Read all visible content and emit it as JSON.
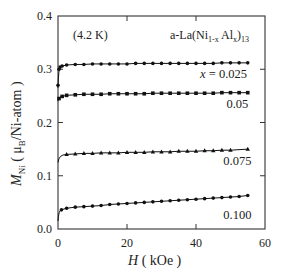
{
  "chart_data": {
    "type": "scatter",
    "title": "a-La(Ni1-x Alx)13",
    "title_parts": {
      "prefix": "a-La(Ni",
      "sub1": "1-x",
      "mid": " Al",
      "sub2": "x",
      "close": ")",
      "sub3": "13"
    },
    "temperature_annotation": "(4.2 K)",
    "xlabel": "H ( kOe )",
    "xlabel_parts": {
      "var": "H",
      "unit": " ( kOe )"
    },
    "ylabel": "M_Ni ( μ_B/Ni-atom )",
    "ylabel_parts": {
      "var": "M",
      "var_sub": "Ni",
      "open": " ( μ",
      "mu_sub": "B",
      "rest": "/Ni-atom )"
    },
    "xlim": [
      0,
      60
    ],
    "ylim": [
      0.0,
      0.4
    ],
    "xticks": [
      0,
      20,
      40,
      60
    ],
    "xtick_labels": [
      "0",
      "20",
      "40",
      "60"
    ],
    "yticks": [
      0.0,
      0.1,
      0.2,
      0.3,
      0.4
    ],
    "ytick_labels": [
      "0.0",
      "0.1",
      "0.2",
      "0.3",
      "0.4"
    ],
    "grid": false,
    "legend": "inline labels",
    "series": [
      {
        "name": "x = 0.025",
        "label": "x = 0.025",
        "label_pos": [
          48,
          0.284
        ],
        "marker": "circle",
        "x": [
          0.0,
          0.3,
          0.6,
          1.2,
          2.5,
          5,
          7.5,
          10,
          12.5,
          15,
          17.5,
          20,
          22.5,
          25,
          27.5,
          30,
          32.5,
          35,
          37.5,
          40,
          42.5,
          45,
          47.5,
          50,
          52.5,
          55
        ],
        "values": [
          0.27,
          0.3,
          0.304,
          0.306,
          0.308,
          0.309,
          0.309,
          0.31,
          0.31,
          0.31,
          0.31,
          0.31,
          0.311,
          0.311,
          0.311,
          0.311,
          0.311,
          0.311,
          0.311,
          0.311,
          0.311,
          0.311,
          0.312,
          0.312,
          0.312,
          0.312
        ]
      },
      {
        "name": "x = 0.05",
        "label": "0.05",
        "label_pos": [
          52,
          0.228
        ],
        "marker": "square",
        "x": [
          0.3,
          1.2,
          2.5,
          5,
          7.5,
          10,
          12.5,
          15,
          17.5,
          20,
          22.5,
          25,
          27.5,
          30,
          32.5,
          35,
          37.5,
          40,
          42.5,
          45,
          47.5,
          50,
          52.5,
          55
        ],
        "values": [
          0.245,
          0.249,
          0.251,
          0.252,
          0.253,
          0.253,
          0.253,
          0.254,
          0.254,
          0.254,
          0.254,
          0.254,
          0.255,
          0.255,
          0.255,
          0.255,
          0.255,
          0.255,
          0.255,
          0.255,
          0.256,
          0.256,
          0.256,
          0.256
        ]
      },
      {
        "name": "x = 0.075",
        "label": "0.075",
        "label_pos": [
          52,
          0.12
        ],
        "marker": "triangle",
        "x": [
          2.5,
          5,
          7.5,
          10,
          12.5,
          15,
          17.5,
          20,
          22.5,
          25,
          27.5,
          30,
          32.5,
          35,
          37.5,
          40,
          42.5,
          45,
          47.5,
          50,
          55
        ],
        "values": [
          0.14,
          0.141,
          0.142,
          0.142,
          0.143,
          0.143,
          0.143,
          0.144,
          0.144,
          0.144,
          0.145,
          0.145,
          0.145,
          0.146,
          0.146,
          0.146,
          0.147,
          0.147,
          0.148,
          0.148,
          0.15
        ]
      },
      {
        "name": "x = 0.100",
        "label": "0.100",
        "label_pos": [
          52,
          0.018
        ],
        "marker": "circle",
        "x": [
          1,
          2.5,
          5,
          7.5,
          10,
          12.5,
          15,
          17.5,
          20,
          22.5,
          25,
          27.5,
          30,
          32.5,
          35,
          37.5,
          40,
          42.5,
          45,
          47.5,
          50,
          52.5,
          55
        ],
        "values": [
          0.036,
          0.039,
          0.041,
          0.042,
          0.043,
          0.044,
          0.046,
          0.047,
          0.048,
          0.049,
          0.05,
          0.051,
          0.052,
          0.053,
          0.054,
          0.055,
          0.056,
          0.057,
          0.058,
          0.059,
          0.06,
          0.061,
          0.063
        ]
      }
    ],
    "fit_curves": [
      {
        "series": "x = 0.025",
        "start_value": 0.265,
        "end_value": 0.312
      },
      {
        "series": "x = 0.05",
        "start_value": 0.24,
        "end_value": 0.256
      },
      {
        "series": "x = 0.075",
        "start_value": 0.125,
        "end_value": 0.15
      },
      {
        "series": "x = 0.100",
        "start_value": 0.015,
        "end_value": 0.063
      }
    ],
    "colors": {
      "axis": "#333333",
      "data": "#111111",
      "text": "#222222",
      "background": "#ffffff"
    }
  }
}
